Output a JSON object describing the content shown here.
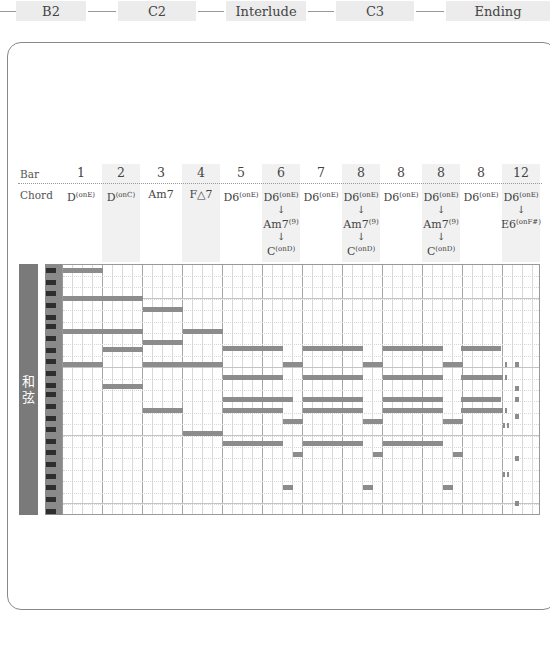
{
  "sections": {
    "items": [
      {
        "label": "B2",
        "x": 16,
        "w": 70
      },
      {
        "label": "C2",
        "x": 118,
        "w": 78
      },
      {
        "label": "Interlude",
        "x": 226,
        "w": 80
      },
      {
        "label": "C3",
        "x": 336,
        "w": 78
      },
      {
        "label": "Ending",
        "x": 446,
        "w": 104
      }
    ],
    "connectors": [
      {
        "x": 0,
        "w": 16
      },
      {
        "x": 88,
        "w": 28
      },
      {
        "x": 198,
        "w": 26
      },
      {
        "x": 308,
        "w": 26
      },
      {
        "x": 416,
        "w": 28
      }
    ]
  },
  "table": {
    "bar_label": "Bar",
    "chord_label": "Chord",
    "columns": [
      {
        "bar": "1",
        "x": 61,
        "shaded": false,
        "chords": [
          {
            "root": "D",
            "sup": "(onE)"
          }
        ]
      },
      {
        "bar": "2",
        "x": 101,
        "shaded": true,
        "chords": [
          {
            "root": "D",
            "sup": "(onC)"
          }
        ]
      },
      {
        "bar": "3",
        "x": 141,
        "shaded": false,
        "chords": [
          {
            "root": "Am7",
            "sup": ""
          }
        ]
      },
      {
        "bar": "4",
        "x": 181,
        "shaded": true,
        "chords": [
          {
            "root": "F△7",
            "sup": ""
          }
        ]
      },
      {
        "bar": "5",
        "x": 221,
        "shaded": false,
        "chords": [
          {
            "root": "D6",
            "sup": "(onE)"
          }
        ]
      },
      {
        "bar": "6",
        "x": 261,
        "shaded": true,
        "chords": [
          {
            "root": "D6",
            "sup": "(onE)"
          },
          {
            "root": "Am7",
            "sup": "(9)"
          },
          {
            "root": "C",
            "sup": "(onD)"
          }
        ]
      },
      {
        "bar": "7",
        "x": 301,
        "shaded": false,
        "chords": [
          {
            "root": "D6",
            "sup": "(onE)"
          }
        ]
      },
      {
        "bar": "8",
        "x": 341,
        "shaded": true,
        "chords": [
          {
            "root": "D6",
            "sup": "(onE)"
          },
          {
            "root": "Am7",
            "sup": "(9)"
          },
          {
            "root": "C",
            "sup": "(onD)"
          }
        ]
      },
      {
        "bar": "8",
        "x": 381,
        "shaded": false,
        "chords": [
          {
            "root": "D6",
            "sup": "(onE)"
          }
        ]
      },
      {
        "bar": "8",
        "x": 421,
        "shaded": true,
        "chords": [
          {
            "root": "D6",
            "sup": "(onE)"
          },
          {
            "root": "Am7",
            "sup": "(9)"
          },
          {
            "root": "C",
            "sup": "(onD)"
          }
        ]
      },
      {
        "bar": "8",
        "x": 461,
        "shaded": false,
        "chords": [
          {
            "root": "D6",
            "sup": "(onE)"
          }
        ]
      },
      {
        "bar": "12",
        "x": 501,
        "shaded": true,
        "chords": [
          {
            "root": "D6",
            "sup": "(onE)"
          },
          {
            "root": "E6",
            "sup": "(onF#)"
          }
        ]
      }
    ]
  },
  "piano_roll": {
    "section_label": "和\n弦",
    "colors": {
      "note": "#8c8c8c",
      "keys_bg": "#8a8a8a",
      "black_key": "#2e2e2e",
      "tag_bg": "#7a7a7a"
    },
    "black_keys_y": [
      4,
      16,
      27,
      39,
      51,
      60,
      72,
      84,
      95,
      107,
      119,
      128,
      140,
      152,
      163,
      175,
      186,
      198,
      210,
      221,
      233,
      245
    ],
    "octave_lines_y": [
      33,
      102,
      170,
      238
    ],
    "notes": [
      {
        "x": 0,
        "y": 3,
        "w": 40
      },
      {
        "x": 0,
        "y": 31,
        "w": 80
      },
      {
        "x": 80,
        "y": 42,
        "w": 40
      },
      {
        "x": 0,
        "y": 64,
        "w": 80
      },
      {
        "x": 120,
        "y": 64,
        "w": 40
      },
      {
        "x": 80,
        "y": 75,
        "w": 40
      },
      {
        "x": 40,
        "y": 82,
        "w": 40
      },
      {
        "x": 0,
        "y": 97,
        "w": 40
      },
      {
        "x": 80,
        "y": 97,
        "w": 40
      },
      {
        "x": 120,
        "y": 97,
        "w": 0
      },
      {
        "x": 160,
        "y": 81,
        "w": 60
      },
      {
        "x": 240,
        "y": 81,
        "w": 60
      },
      {
        "x": 320,
        "y": 81,
        "w": 60
      },
      {
        "x": 398,
        "y": 81,
        "w": 40
      },
      {
        "x": 120,
        "y": 97,
        "w": 40
      },
      {
        "x": 220,
        "y": 97,
        "w": 20
      },
      {
        "x": 300,
        "y": 97,
        "w": 20
      },
      {
        "x": 380,
        "y": 97,
        "w": 20
      },
      {
        "x": 160,
        "y": 110,
        "w": 60
      },
      {
        "x": 240,
        "y": 110,
        "w": 60
      },
      {
        "x": 320,
        "y": 110,
        "w": 60
      },
      {
        "x": 398,
        "y": 110,
        "w": 42
      },
      {
        "x": 40,
        "y": 119,
        "w": 40
      },
      {
        "x": 160,
        "y": 132,
        "w": 60
      },
      {
        "x": 240,
        "y": 132,
        "w": 60
      },
      {
        "x": 320,
        "y": 132,
        "w": 60
      },
      {
        "x": 398,
        "y": 132,
        "w": 40
      },
      {
        "x": 220,
        "y": 132,
        "w": 10
      },
      {
        "x": 160,
        "y": 143,
        "w": 60
      },
      {
        "x": 240,
        "y": 143,
        "w": 60
      },
      {
        "x": 320,
        "y": 143,
        "w": 60
      },
      {
        "x": 398,
        "y": 143,
        "w": 42
      },
      {
        "x": 220,
        "y": 154,
        "w": 20
      },
      {
        "x": 300,
        "y": 154,
        "w": 20
      },
      {
        "x": 380,
        "y": 154,
        "w": 20
      },
      {
        "x": 80,
        "y": 143,
        "w": 40
      },
      {
        "x": 120,
        "y": 166,
        "w": 40
      },
      {
        "x": 160,
        "y": 176,
        "w": 60
      },
      {
        "x": 240,
        "y": 176,
        "w": 60
      },
      {
        "x": 320,
        "y": 176,
        "w": 60
      },
      {
        "x": 230,
        "y": 187,
        "w": 10
      },
      {
        "x": 310,
        "y": 187,
        "w": 10
      },
      {
        "x": 390,
        "y": 187,
        "w": 10
      },
      {
        "x": 220,
        "y": 220,
        "w": 10
      },
      {
        "x": 300,
        "y": 220,
        "w": 10
      },
      {
        "x": 380,
        "y": 220,
        "w": 10
      },
      {
        "x": 442,
        "y": 97,
        "w": 2
      },
      {
        "x": 442,
        "y": 110,
        "w": 2
      },
      {
        "x": 442,
        "y": 143,
        "w": 2
      },
      {
        "x": 440,
        "y": 158,
        "w": 2
      },
      {
        "x": 444,
        "y": 158,
        "w": 2
      },
      {
        "x": 440,
        "y": 207,
        "w": 2
      },
      {
        "x": 444,
        "y": 207,
        "w": 2
      },
      {
        "x": 452,
        "y": 97,
        "w": 4
      },
      {
        "x": 452,
        "y": 121,
        "w": 4
      },
      {
        "x": 452,
        "y": 132,
        "w": 4
      },
      {
        "x": 452,
        "y": 149,
        "w": 4
      },
      {
        "x": 452,
        "y": 191,
        "w": 4
      },
      {
        "x": 452,
        "y": 236,
        "w": 4
      }
    ]
  }
}
